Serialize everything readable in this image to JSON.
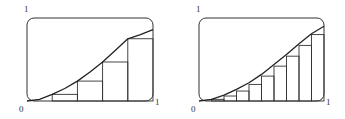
{
  "chart_data": [
    {
      "type": "bar",
      "title": "",
      "description": "Increasing curve on [0,1] with 5 left-endpoint rectangles",
      "xlim": [
        0,
        1
      ],
      "ylim": [
        0,
        1
      ],
      "axis_labels": {
        "origin": "0",
        "x_max": "1",
        "y_max": "1"
      },
      "intervals": 5,
      "x_edges": [
        0,
        0.2,
        0.4,
        0.6,
        0.8,
        1.0
      ],
      "rect_heights": [
        0.0,
        0.08,
        0.24,
        0.47,
        0.75
      ],
      "curve": {
        "x": [
          0,
          0.1,
          0.2,
          0.3,
          0.4,
          0.5,
          0.6,
          0.7,
          0.8,
          0.9,
          1.0
        ],
        "y": [
          0,
          0.02,
          0.08,
          0.15,
          0.24,
          0.35,
          0.47,
          0.61,
          0.75,
          0.8,
          0.86
        ]
      },
      "grid": false
    },
    {
      "type": "bar",
      "title": "",
      "description": "Same curve on [0,1] with 10 left-endpoint rectangles",
      "xlim": [
        0,
        1
      ],
      "ylim": [
        0,
        1
      ],
      "axis_labels": {
        "origin": "0",
        "x_max": "1",
        "y_max": "1"
      },
      "intervals": 10,
      "x_edges": [
        0,
        0.1,
        0.2,
        0.3,
        0.4,
        0.5,
        0.6,
        0.7,
        0.8,
        0.9,
        1.0
      ],
      "rect_heights": [
        0.0,
        0.02,
        0.06,
        0.12,
        0.2,
        0.3,
        0.42,
        0.54,
        0.67,
        0.8
      ],
      "curve": {
        "x": [
          0,
          0.1,
          0.2,
          0.3,
          0.4,
          0.5,
          0.6,
          0.7,
          0.8,
          0.9,
          1.0
        ],
        "y": [
          0,
          0.02,
          0.07,
          0.14,
          0.22,
          0.32,
          0.44,
          0.56,
          0.69,
          0.81,
          0.9
        ]
      },
      "grid": false
    }
  ],
  "labels": {
    "left": {
      "y_max": "1",
      "origin": "0",
      "x_max": "1"
    },
    "right": {
      "y_max": "1",
      "origin": "0",
      "x_max": "1"
    }
  },
  "style": {
    "stroke": "#333333",
    "curve": "#222222"
  }
}
